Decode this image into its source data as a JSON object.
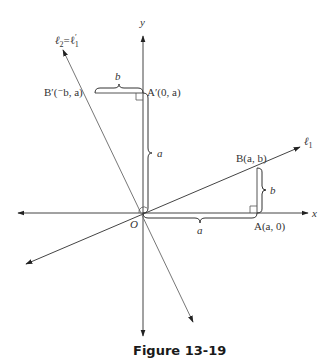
{
  "figure": {
    "caption": "Figure 13-19",
    "colors": {
      "axis": "#333333",
      "line": "#555555",
      "brace": "#333333",
      "text": "#333333"
    },
    "axes": {
      "x_label": "x",
      "y_label": "y",
      "origin_label": "O"
    },
    "lines": [
      {
        "id": "l1",
        "label_main": "ℓ",
        "label_sub": "1"
      },
      {
        "id": "l2",
        "label_main": "ℓ",
        "label_sub": "2",
        "label_eq": "=ℓ",
        "label_prime": "′",
        "label_sub2": "1"
      }
    ],
    "points": {
      "B": {
        "text": "B(a, b)"
      },
      "A": {
        "text": "A(a, 0)"
      },
      "A_prime": {
        "text": "A′(0, a)"
      },
      "B_prime": {
        "text": "B′(⁻b, a)"
      }
    },
    "braces": {
      "b_top": "b",
      "a_vertical": "a",
      "a_horizontal": "a",
      "b_right": "b"
    }
  }
}
